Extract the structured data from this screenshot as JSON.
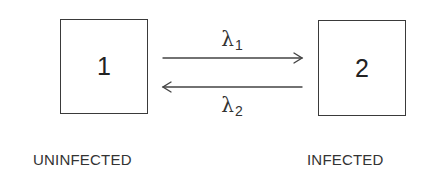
{
  "diagram": {
    "type": "two-state transition model",
    "states": [
      {
        "id": "1",
        "label": "UNINFECTED"
      },
      {
        "id": "2",
        "label": "INFECTED"
      }
    ],
    "transitions": [
      {
        "from": "1",
        "to": "2",
        "rate_symbol": "λ",
        "rate_sub": "1"
      },
      {
        "from": "2",
        "to": "1",
        "rate_symbol": "λ",
        "rate_sub": "2"
      }
    ],
    "colors": {
      "line": "#3a3a3a",
      "text": "#333333",
      "background": "#ffffff"
    }
  }
}
